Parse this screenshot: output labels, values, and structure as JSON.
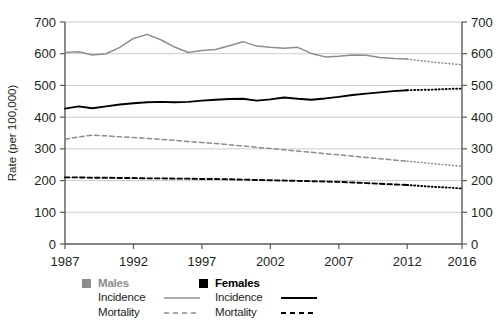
{
  "chart_data": {
    "type": "line",
    "title": "",
    "xlabel": "",
    "ylabel": "Rate (per 100,000)",
    "xlim": [
      1987,
      2016
    ],
    "ylim": [
      0,
      700
    ],
    "yticks": [
      0,
      100,
      200,
      300,
      400,
      500,
      600,
      700
    ],
    "xticks": [
      1987,
      1992,
      1997,
      2002,
      2007,
      2012,
      2016
    ],
    "grid": "horizontal",
    "dual_y_axis": true,
    "legend_position": "bottom",
    "projection_start_year": 2012,
    "x": [
      1987,
      1988,
      1989,
      1990,
      1991,
      1992,
      1993,
      1994,
      1995,
      1996,
      1997,
      1998,
      1999,
      2000,
      2001,
      2002,
      2003,
      2004,
      2005,
      2006,
      2007,
      2008,
      2009,
      2010,
      2011,
      2012,
      2013,
      2014,
      2015,
      2016
    ],
    "series": [
      {
        "name": "Males Incidence",
        "color": "#8d8d8d",
        "style": "solid",
        "projection_style": "dotted",
        "values": [
          604,
          606,
          596,
          600,
          620,
          648,
          661,
          644,
          621,
          604,
          610,
          613,
          625,
          638,
          624,
          620,
          617,
          620,
          601,
          590,
          592,
          596,
          595,
          588,
          585,
          583,
          578,
          573,
          569,
          565
        ]
      },
      {
        "name": "Males Mortality",
        "color": "#8d8d8d",
        "style": "dashed",
        "projection_style": "dotted",
        "values": [
          330,
          338,
          343,
          341,
          338,
          336,
          333,
          330,
          327,
          323,
          320,
          317,
          313,
          309,
          305,
          301,
          297,
          293,
          289,
          285,
          281,
          277,
          273,
          269,
          265,
          261,
          257,
          253,
          249,
          245
        ]
      },
      {
        "name": "Females Incidence",
        "color": "#000000",
        "style": "solid",
        "projection_style": "dotted",
        "values": [
          427,
          434,
          428,
          434,
          440,
          444,
          447,
          448,
          447,
          448,
          452,
          455,
          457,
          458,
          452,
          456,
          462,
          458,
          455,
          459,
          464,
          470,
          474,
          478,
          482,
          485,
          486,
          487,
          489,
          490
        ]
      },
      {
        "name": "Females Mortality",
        "color": "#000000",
        "style": "dashed",
        "projection_style": "dotted",
        "values": [
          210,
          210,
          209,
          209,
          208,
          208,
          207,
          207,
          206,
          206,
          205,
          205,
          204,
          203,
          202,
          201,
          200,
          199,
          198,
          197,
          196,
          194,
          192,
          190,
          188,
          186,
          183,
          180,
          178,
          175
        ]
      }
    ]
  },
  "axes": {
    "y_title": "Rate (per 100,000)",
    "y_labels_left": [
      "700",
      "600",
      "500",
      "400",
      "300",
      "200",
      "100",
      "0"
    ],
    "y_labels_right": [
      "700",
      "600",
      "500",
      "400",
      "300",
      "200",
      "100",
      "0"
    ],
    "x_labels": [
      "1987",
      "1992",
      "1997",
      "2002",
      "2007",
      "2012",
      "2016"
    ]
  },
  "legend": {
    "males": {
      "title": "Males",
      "swatch_color": "#8d8d8d",
      "rows": [
        {
          "label": "Incidence",
          "style": "solid"
        },
        {
          "label": "Mortality",
          "style": "dashed"
        }
      ]
    },
    "females": {
      "title": "Females",
      "swatch_color": "#000000",
      "rows": [
        {
          "label": "Incidence",
          "style": "solid"
        },
        {
          "label": "Mortality",
          "style": "dashed"
        }
      ]
    }
  },
  "caption": ""
}
